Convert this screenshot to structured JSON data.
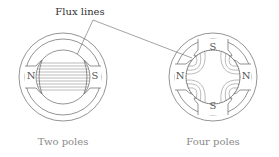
{
  "annotation": {
    "label": "Flux lines"
  },
  "motors": [
    {
      "caption": "Two poles",
      "poles": [
        "N",
        "S"
      ]
    },
    {
      "caption": "Four poles",
      "poles": [
        "S",
        "N",
        "S",
        "N"
      ]
    }
  ],
  "colors": {
    "line": "#555555",
    "text": "#333333",
    "caption": "#8a8a8a"
  }
}
